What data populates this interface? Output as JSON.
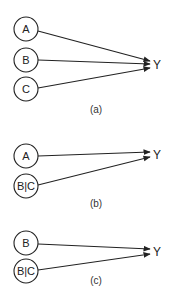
{
  "diagram": {
    "type": "causal-graph-panels",
    "panels": [
      {
        "id": "a",
        "caption": "(a)",
        "target": "Y",
        "nodes": [
          {
            "label": "A"
          },
          {
            "label": "B"
          },
          {
            "label": "C"
          }
        ],
        "edges": [
          {
            "from": "A",
            "to": "Y"
          },
          {
            "from": "B",
            "to": "Y"
          },
          {
            "from": "C",
            "to": "Y"
          }
        ]
      },
      {
        "id": "b",
        "caption": "(b)",
        "target": "Y",
        "nodes": [
          {
            "label": "A"
          },
          {
            "label": "B|C"
          }
        ],
        "edges": [
          {
            "from": "A",
            "to": "Y"
          },
          {
            "from": "B|C",
            "to": "Y"
          }
        ]
      },
      {
        "id": "c",
        "caption": "(c)",
        "target": "Y",
        "nodes": [
          {
            "label": "B"
          },
          {
            "label": "B|C"
          }
        ],
        "edges": [
          {
            "from": "B",
            "to": "Y"
          },
          {
            "from": "B|C",
            "to": "Y"
          }
        ]
      }
    ],
    "colors": {
      "stroke": "#222222",
      "background": "#ffffff"
    }
  }
}
